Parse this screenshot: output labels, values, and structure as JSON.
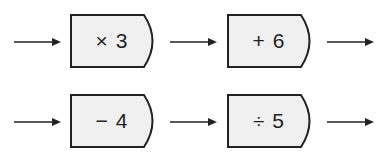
{
  "diagram": {
    "type": "function-machine-flow",
    "colors": {
      "box_fill": "#f0f0f0",
      "stroke": "#222222"
    },
    "rows": [
      {
        "operations": [
          {
            "label": "× 3"
          },
          {
            "label": "+ 6"
          }
        ]
      },
      {
        "operations": [
          {
            "label": "− 4"
          },
          {
            "label": "÷ 5"
          }
        ]
      }
    ]
  }
}
